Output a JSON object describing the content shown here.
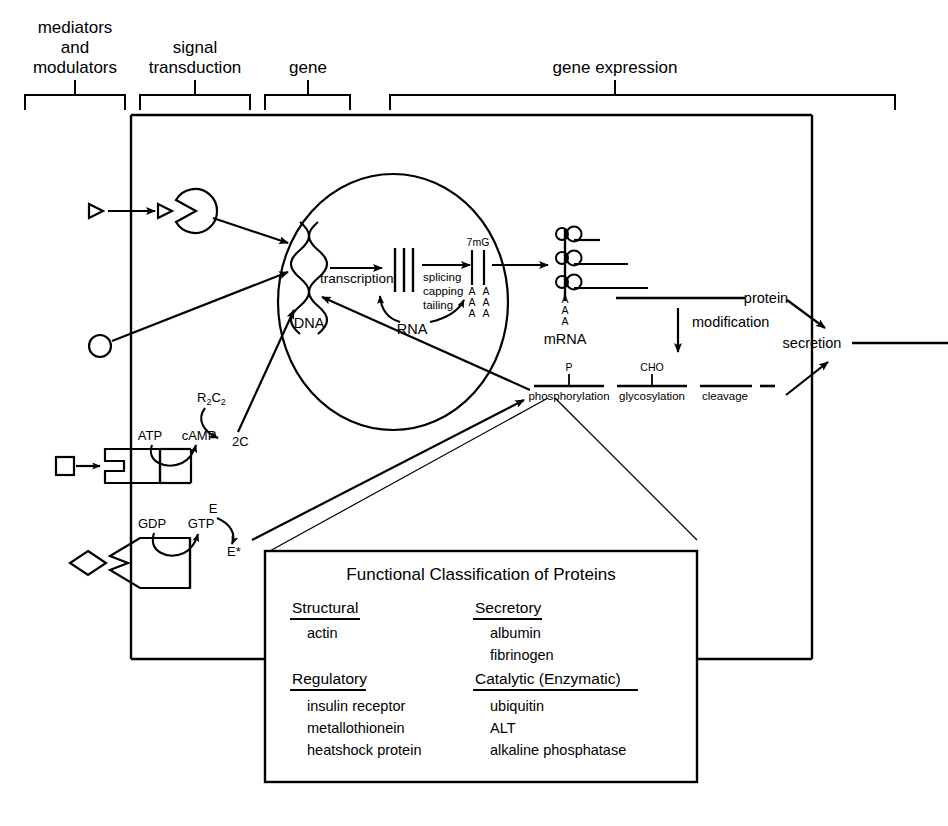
{
  "figure": {
    "type": "cell-biology-schematic",
    "title_implicit": "Gene expression and protein processing in the cell"
  },
  "top_sections": [
    {
      "id": "mediators",
      "lines": [
        "mediators",
        "and",
        "modulators"
      ],
      "bracket": {
        "x1": 25,
        "x2": 125,
        "tick": 75
      }
    },
    {
      "id": "signal",
      "lines": [
        "signal",
        "transduction"
      ],
      "bracket": {
        "x1": 140,
        "x2": 250,
        "tick": 195
      }
    },
    {
      "id": "gene",
      "lines": [
        "gene"
      ],
      "bracket": {
        "x1": 265,
        "x2": 350,
        "tick": 308
      }
    },
    {
      "id": "expression",
      "lines": [
        "gene  expression"
      ],
      "bracket": {
        "x1": 390,
        "x2": 895,
        "tick": 615
      }
    }
  ],
  "nucleus": {
    "dna_label": "DNA",
    "transcription_label": "transcription",
    "rna_label": "RNA",
    "processing_steps": [
      "splicing",
      "capping",
      "tailing"
    ],
    "cap_label": "7mG",
    "polyA_letter": "A",
    "polyA_count": 3
  },
  "cytoplasm": {
    "mrna_label": "mRNA",
    "protein_label": "protein",
    "modification_label": "modification",
    "secretion_label": "secretion",
    "modifications": [
      {
        "name": "phosphorylation",
        "group": "P"
      },
      {
        "name": "glycosylation",
        "group": "CHO"
      },
      {
        "name": "cleavage",
        "group": ""
      }
    ]
  },
  "signal_transduction": {
    "camp_pathway": {
      "substrate": "ATP",
      "product": "cAMP",
      "holoenzyme": "R2C2",
      "holoenzyme_display": "R₂C₂",
      "subunit": "2C",
      "ligand_shape": "square"
    },
    "g_protein_pathway": {
      "substrate": "GDP",
      "product": "GTP",
      "effector": "E",
      "effector_active": "E*",
      "ligand_shape": "diamond"
    },
    "direct_ligands": [
      {
        "shape": "triangle",
        "receptor": "pac-man-receptor"
      },
      {
        "shape": "circle",
        "receptor": "none"
      }
    ]
  },
  "inset": {
    "title": "Functional Classification of Proteins",
    "columns": [
      {
        "groups": [
          {
            "heading": "Structural",
            "items": [
              "actin"
            ]
          },
          {
            "heading": "Regulatory",
            "items": [
              "insulin receptor",
              "metallothionein",
              "heatshock protein"
            ]
          }
        ]
      },
      {
        "groups": [
          {
            "heading": "Secretory",
            "items": [
              "albumin",
              "fibrinogen"
            ]
          },
          {
            "heading": "Catalytic (Enzymatic)",
            "items": [
              "ubiquitin",
              "ALT",
              "alkaline phosphatase"
            ]
          }
        ]
      }
    ]
  },
  "colors": {
    "ink": "#000000",
    "background": "#ffffff"
  }
}
